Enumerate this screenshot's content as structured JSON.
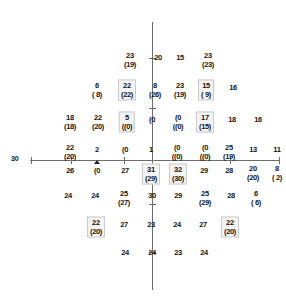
{
  "chart_data": {
    "type": "scatter",
    "title": "",
    "xlabel": "",
    "ylabel": "",
    "grid": false,
    "legend": null,
    "axis": {
      "left_tick_label": "30",
      "horizontal_axis_visible": true,
      "vertical_axis_visible": true
    },
    "notation": "Each point shows the measured threshold sensitivity (dB) with the age-corrected / second value in parentheses below. Boxed points are highlighted.",
    "points": [
      {
        "id": "p1",
        "x": 130,
        "y": 60,
        "top": "23",
        "bot": "(19)",
        "boxed": false
      },
      {
        "id": "p2",
        "x": 158,
        "y": 57,
        "top": "20",
        "bot": "",
        "boxed": false
      },
      {
        "id": "p3",
        "x": 180,
        "y": 57,
        "top": "15",
        "bot": "",
        "boxed": false
      },
      {
        "id": "p4",
        "x": 208,
        "y": 60,
        "top": "23",
        "bot": "(23)",
        "boxed": false
      },
      {
        "id": "p5",
        "x": 97,
        "y": 90,
        "top": "6",
        "bot": "( 8)",
        "boxed": false
      },
      {
        "id": "p6",
        "x": 127,
        "y": 90,
        "top": "22",
        "bot": "(22)",
        "boxed": true
      },
      {
        "id": "p7",
        "x": 155,
        "y": 90,
        "top": "8",
        "bot": "(26)",
        "boxed": false
      },
      {
        "id": "p8",
        "x": 180,
        "y": 90,
        "top": "23",
        "bot": "(19)",
        "boxed": false
      },
      {
        "id": "p9",
        "x": 206,
        "y": 90,
        "top": "15",
        "bot": "( 9)",
        "boxed": true
      },
      {
        "id": "p10",
        "x": 233,
        "y": 87,
        "top": "16",
        "bot": "",
        "boxed": false
      },
      {
        "id": "p11",
        "x": 70,
        "y": 122,
        "top": "18",
        "bot": "(18)",
        "boxed": false
      },
      {
        "id": "p12",
        "x": 98,
        "y": 122,
        "top": "22",
        "bot": "(20)",
        "boxed": false
      },
      {
        "id": "p13",
        "x": 127,
        "y": 122,
        "top": "5",
        "bot": "((0)",
        "boxed": true
      },
      {
        "id": "p14",
        "x": 152,
        "y": 119,
        "top": "(0",
        "bot": "",
        "boxed": false
      },
      {
        "id": "p15",
        "x": 178,
        "y": 122,
        "top": "(0",
        "bot": "((0)",
        "boxed": false
      },
      {
        "id": "p16",
        "x": 205,
        "y": 122,
        "top": "17",
        "bot": "(15)",
        "boxed": true
      },
      {
        "id": "p17",
        "x": 232,
        "y": 119,
        "top": "18",
        "bot": "",
        "boxed": false
      },
      {
        "id": "p18",
        "x": 258,
        "y": 119,
        "top": "16",
        "bot": "",
        "boxed": false
      },
      {
        "id": "p19",
        "x": 70,
        "y": 152,
        "top": "22",
        "bot": "(20)",
        "boxed": false
      },
      {
        "id": "p20",
        "x": 97,
        "y": 149,
        "top": "2",
        "bot": "",
        "boxed": false
      },
      {
        "id": "p21",
        "x": 125,
        "y": 149,
        "top": "(0",
        "bot": "",
        "boxed": false
      },
      {
        "id": "p22",
        "x": 151,
        "y": 149,
        "top": "1",
        "bot": "",
        "boxed": false
      },
      {
        "id": "p23",
        "x": 177,
        "y": 152,
        "top": "(0",
        "bot": "((0)",
        "boxed": false
      },
      {
        "id": "p24",
        "x": 205,
        "y": 152,
        "top": "(0",
        "bot": "((0)",
        "boxed": false
      },
      {
        "id": "p25",
        "x": 229,
        "y": 152,
        "top": "25",
        "bot": "(19)",
        "boxed": false
      },
      {
        "id": "p26",
        "x": 253,
        "y": 149,
        "top": "13",
        "bot": "",
        "boxed": false
      },
      {
        "id": "p27",
        "x": 277,
        "y": 149,
        "top": "11",
        "bot": "",
        "boxed": false
      },
      {
        "id": "p28",
        "x": 70,
        "y": 170,
        "top": "26",
        "bot": "",
        "boxed": false
      },
      {
        "id": "p29",
        "x": 97,
        "y": 170,
        "top": "(0",
        "bot": "",
        "boxed": false
      },
      {
        "id": "p30",
        "x": 125,
        "y": 170,
        "top": "27",
        "bot": "",
        "boxed": false
      },
      {
        "id": "p31",
        "x": 151,
        "y": 174,
        "top": "31",
        "bot": "(29)",
        "boxed": true
      },
      {
        "id": "p32",
        "x": 178,
        "y": 174,
        "top": "32",
        "bot": "(30)",
        "boxed": true
      },
      {
        "id": "p33",
        "x": 204,
        "y": 170,
        "top": "29",
        "bot": "",
        "boxed": false
      },
      {
        "id": "p34",
        "x": 229,
        "y": 170,
        "top": "28",
        "bot": "",
        "boxed": false
      },
      {
        "id": "p35",
        "x": 253,
        "y": 173,
        "top": "20",
        "bot": "(20)",
        "boxed": false
      },
      {
        "id": "p36",
        "x": 277,
        "y": 173,
        "top": "8",
        "bot": "( 2)",
        "boxed": false
      },
      {
        "id": "p37",
        "x": 68,
        "y": 195,
        "top": "24",
        "bot": "",
        "boxed": false
      },
      {
        "id": "p38",
        "x": 95,
        "y": 195,
        "top": "24",
        "bot": "",
        "boxed": false
      },
      {
        "id": "p39",
        "x": 124,
        "y": 198,
        "top": "25",
        "bot": "(27)",
        "boxed": false
      },
      {
        "id": "p40",
        "x": 152,
        "y": 195,
        "top": "30",
        "bot": "",
        "boxed": false
      },
      {
        "id": "p41",
        "x": 178,
        "y": 195,
        "top": "29",
        "bot": "",
        "boxed": false
      },
      {
        "id": "p42",
        "x": 205,
        "y": 198,
        "top": "25",
        "bot": "(29)",
        "boxed": false
      },
      {
        "id": "p43",
        "x": 231,
        "y": 195,
        "top": "28",
        "bot": "",
        "boxed": false
      },
      {
        "id": "p44",
        "x": 256,
        "y": 198,
        "top": "6",
        "bot": "( 6)",
        "boxed": false
      },
      {
        "id": "p45",
        "x": 96,
        "y": 227,
        "top": "22",
        "bot": "(20)",
        "boxed": true
      },
      {
        "id": "p46",
        "x": 124,
        "y": 224,
        "top": "27",
        "bot": "",
        "boxed": false
      },
      {
        "id": "p47",
        "x": 151,
        "y": 224,
        "top": "23",
        "bot": "",
        "boxed": false
      },
      {
        "id": "p48",
        "x": 177,
        "y": 224,
        "top": "24",
        "bot": "",
        "boxed": false
      },
      {
        "id": "p49",
        "x": 203,
        "y": 224,
        "top": "27",
        "bot": "",
        "boxed": false
      },
      {
        "id": "p50",
        "x": 230,
        "y": 227,
        "top": "22",
        "bot": "(20)",
        "boxed": true
      },
      {
        "id": "p51",
        "x": 125,
        "y": 252,
        "top": "24",
        "bot": "",
        "boxed": false
      },
      {
        "id": "p52",
        "x": 152,
        "y": 252,
        "top": "24",
        "bot": "",
        "boxed": false
      },
      {
        "id": "p53",
        "x": 178,
        "y": 252,
        "top": "23",
        "bot": "",
        "boxed": false
      },
      {
        "id": "p54",
        "x": 204,
        "y": 252,
        "top": "24",
        "bot": "",
        "boxed": false
      }
    ]
  }
}
